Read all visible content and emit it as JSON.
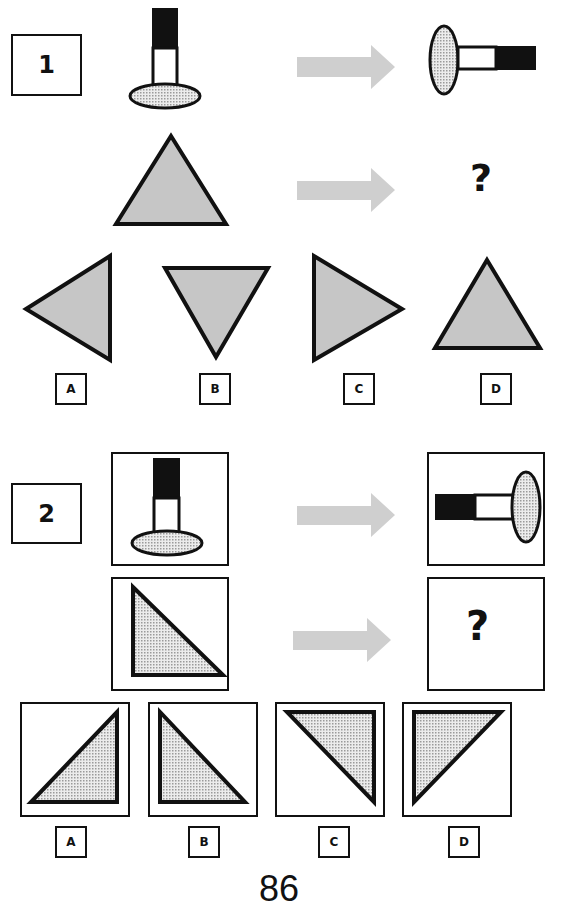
{
  "page": {
    "page_number": "86"
  },
  "colors": {
    "ink": "#111111",
    "triangle_fill": "#c6c6c6",
    "arrow_fill": "#cfcfcf",
    "dotted_fill": "#d9d9d9"
  },
  "puzzles": [
    {
      "number": "1",
      "example": {
        "source": "upright key: black top bar, white stem, dotted oval base",
        "result": "key rotated 90° counter-clockwise lying on its side: dotted oval on left, white then black bar to right"
      },
      "question": {
        "source": "upright gray equilateral triangle",
        "unknown": "?"
      },
      "options": [
        {
          "label": "A",
          "shape": "triangle pointing left"
        },
        {
          "label": "B",
          "shape": "triangle pointing down"
        },
        {
          "label": "C",
          "shape": "triangle pointing right"
        },
        {
          "label": "D",
          "shape": "triangle pointing up"
        }
      ]
    },
    {
      "number": "2",
      "example": {
        "source": "upright key in frame: black top bar, white stem, dotted oval base",
        "result": "key lying on its side in frame: black bar on left, white stem, dotted oval on right"
      },
      "question": {
        "source": "dotted right triangle in frame, right angle at bottom-left",
        "unknown": "?"
      },
      "options": [
        {
          "label": "A",
          "shape": "right triangle, right angle bottom-right"
        },
        {
          "label": "B",
          "shape": "right triangle, right angle bottom-left"
        },
        {
          "label": "C",
          "shape": "right triangle, right angle top-right"
        },
        {
          "label": "D",
          "shape": "right triangle, right angle top-left"
        }
      ]
    }
  ]
}
